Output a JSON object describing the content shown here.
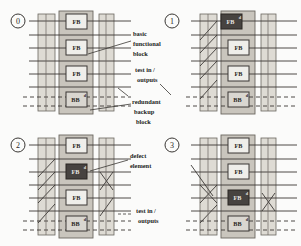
{
  "figure": {
    "type": "technical-diagram",
    "panel_count": 4
  },
  "panels": [
    {
      "id": "0",
      "position": "top-left",
      "blocks": [
        {
          "label": "FB",
          "state": "ok"
        },
        {
          "label": "FB",
          "state": "ok"
        },
        {
          "label": "FB",
          "state": "ok"
        },
        {
          "label": "BB",
          "state": "backup"
        }
      ]
    },
    {
      "id": "1",
      "position": "top-right",
      "blocks": [
        {
          "label": "FB",
          "state": "defect"
        },
        {
          "label": "FB",
          "state": "ok"
        },
        {
          "label": "FB",
          "state": "ok"
        },
        {
          "label": "BB",
          "state": "backup"
        }
      ]
    },
    {
      "id": "2",
      "position": "bottom-left",
      "blocks": [
        {
          "label": "FB",
          "state": "ok"
        },
        {
          "label": "FB",
          "state": "defect"
        },
        {
          "label": "FB",
          "state": "ok"
        },
        {
          "label": "BB",
          "state": "backup"
        }
      ]
    },
    {
      "id": "3",
      "position": "bottom-right",
      "blocks": [
        {
          "label": "FB",
          "state": "ok"
        },
        {
          "label": "FB",
          "state": "ok"
        },
        {
          "label": "FB",
          "state": "defect"
        },
        {
          "label": "BB",
          "state": "backup"
        }
      ]
    }
  ],
  "annotations": [
    {
      "key": "basic_functional_block",
      "lines": [
        "basic",
        "functional",
        "block"
      ]
    },
    {
      "key": "test_in_outputs_top",
      "lines": [
        "test in /",
        "outputs"
      ]
    },
    {
      "key": "redundant_backup_block",
      "lines": [
        "redundant",
        "backup",
        "block"
      ]
    },
    {
      "key": "defect_element",
      "lines": [
        "defect",
        "element"
      ]
    },
    {
      "key": "test_in_outputs_bottom",
      "lines": [
        "test in /",
        "outputs"
      ]
    }
  ],
  "colors": {
    "background": "#fbfbfa",
    "band_light": "#dedbd4",
    "band_mid": "#c9c5bd",
    "block_fill": "#efeeea",
    "block_defect": "#474340",
    "line": "#3a3734",
    "text": "#231f1c"
  }
}
